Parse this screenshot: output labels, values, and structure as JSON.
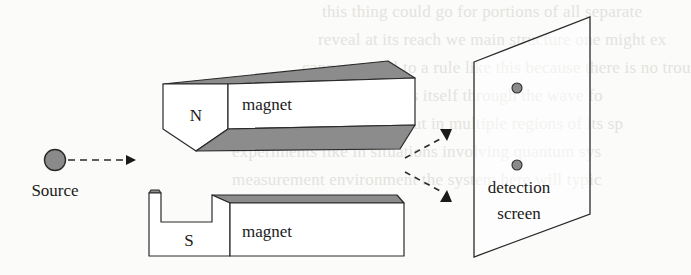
{
  "diagram": {
    "labels": {
      "source": "Source",
      "north_pole": "N",
      "south_pole": "S",
      "top_magnet": "magnet",
      "bottom_magnet": "magnet",
      "screen_line1": "detection",
      "screen_line2": "screen"
    },
    "colors": {
      "stroke": "#2a2a2a",
      "shade": "#8c8c8c",
      "dot_fill": "#8a8a8a",
      "background": "#fbfbfa"
    },
    "background_bleed_text": [
      "this thing could go for portions of all separate",
      "reveal at its reach we main structure one might ex",
      "cannot appeal to a rule like this because there is no trou",
      "of the wave unit which is itself through the wave fo",
      "will generally be spread out in multiple regions of its sp",
      "experiments like in situations involving quantum sys",
      "measurement environment the system here will typic"
    ]
  }
}
